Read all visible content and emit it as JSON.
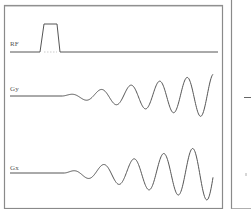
{
  "diagram": {
    "type": "pulse-sequence",
    "channels": [
      {
        "label": "RF",
        "waveform": "trapezoid-pulse"
      },
      {
        "label": "Gy",
        "waveform": "oscillating-growing-sinusoid"
      },
      {
        "label": "Gx",
        "waveform": "oscillating-growing-sinusoid"
      }
    ],
    "colors": {
      "frame": "#7a7a7a",
      "trace": "#555555",
      "background": "#ffffff"
    }
  }
}
